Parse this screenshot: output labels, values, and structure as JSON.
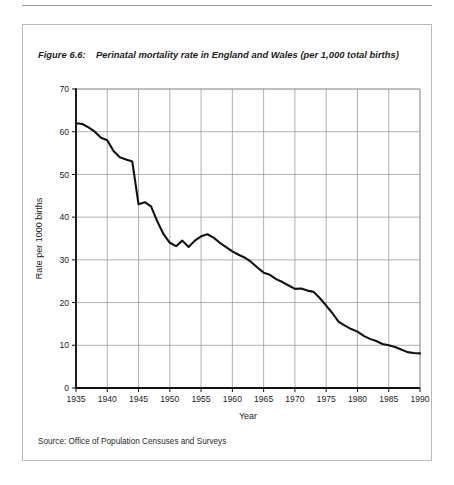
{
  "page": {
    "number": ""
  },
  "figure": {
    "label": "Figure 6.6:",
    "title": "Perinatal mortality rate in England and Wales (per 1,000 total births)",
    "source": "Source: Office of Population Censuses and Surveys"
  },
  "colors": {
    "line": "#111111",
    "grid": "#8f8f8f",
    "axis": "#111111",
    "border": "#b9b9b9",
    "background": "#ffffff"
  },
  "chart_data": {
    "type": "line",
    "title": "Perinatal mortality rate in England and Wales (per 1,000 total births)",
    "xlabel": "Year",
    "ylabel": "Rate per 1000 births",
    "xlim": [
      1935,
      1990
    ],
    "ylim": [
      0,
      70
    ],
    "xticks": [
      1935,
      1940,
      1945,
      1950,
      1955,
      1960,
      1965,
      1970,
      1975,
      1980,
      1985,
      1990
    ],
    "yticks": [
      0,
      10,
      20,
      30,
      40,
      50,
      60,
      70
    ],
    "grid": true,
    "legend": "none",
    "series": [
      {
        "name": "Perinatal mortality rate",
        "x": [
          1935,
          1936,
          1937,
          1938,
          1939,
          1940,
          1941,
          1942,
          1943,
          1944,
          1945,
          1946,
          1947,
          1948,
          1949,
          1950,
          1951,
          1952,
          1953,
          1954,
          1955,
          1956,
          1957,
          1958,
          1959,
          1960,
          1961,
          1962,
          1963,
          1964,
          1965,
          1966,
          1967,
          1968,
          1969,
          1970,
          1971,
          1972,
          1973,
          1974,
          1975,
          1976,
          1977,
          1978,
          1979,
          1980,
          1981,
          1982,
          1983,
          1984,
          1985,
          1986,
          1987,
          1988,
          1989,
          1990
        ],
        "values": [
          62.0,
          61.8,
          61.0,
          60.0,
          58.6,
          58.0,
          55.5,
          54.0,
          53.5,
          53.0,
          43.0,
          43.5,
          42.5,
          39.0,
          36.0,
          34.0,
          33.2,
          34.5,
          33.0,
          34.5,
          35.5,
          36.0,
          35.2,
          34.0,
          33.0,
          32.0,
          31.2,
          30.5,
          29.5,
          28.2,
          27.0,
          26.5,
          25.5,
          24.8,
          24.0,
          23.2,
          23.3,
          22.8,
          22.5,
          21.0,
          19.3,
          17.5,
          15.5,
          14.6,
          13.8,
          13.2,
          12.2,
          11.5,
          11.0,
          10.3,
          10.0,
          9.6,
          9.0,
          8.4,
          8.2,
          8.1
        ]
      }
    ]
  }
}
